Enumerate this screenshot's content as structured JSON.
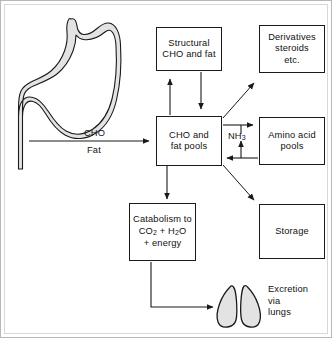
{
  "diagram": {
    "colors": {
      "stroke": "#1a1a1a",
      "organ_fill": "#e3e3e3",
      "page_border": "#b8b8b8",
      "background": "#ffffff"
    },
    "boxes": [
      {
        "id": "structural",
        "lines": [
          "Structural",
          "CHO and fat"
        ]
      },
      {
        "id": "derivatives",
        "lines": [
          "Derivatives",
          "steroids",
          "etc."
        ]
      },
      {
        "id": "central",
        "lines": [
          "CHO and",
          "fat pools"
        ]
      },
      {
        "id": "amino",
        "lines": [
          "Amino acid",
          "pools"
        ]
      },
      {
        "id": "catabolism",
        "lines": [
          "Catabolism to",
          "CO2 + H2O",
          "+ energy"
        ]
      },
      {
        "id": "storage",
        "lines": [
          "Storage"
        ]
      }
    ],
    "labels": {
      "cho": "CHO",
      "fat": "Fat",
      "nh3": "NH3",
      "excretion": [
        "Excretion",
        "via",
        "lungs"
      ]
    },
    "organs": [
      {
        "id": "stomach",
        "name": "stomach-illustration"
      },
      {
        "id": "lungs",
        "name": "lungs-illustration"
      }
    ],
    "arrows": [
      {
        "from": "stomach",
        "to": "central",
        "label": "CHO / Fat"
      },
      {
        "from": "central",
        "to": "structural",
        "label": ""
      },
      {
        "from": "structural",
        "to": "central",
        "label": ""
      },
      {
        "from": "central",
        "to": "derivatives",
        "label": ""
      },
      {
        "from": "central",
        "to": "amino",
        "label": ""
      },
      {
        "from": "amino",
        "to": "central",
        "label": ""
      },
      {
        "from": "amino",
        "to": "central",
        "label": "NH3"
      },
      {
        "from": "central",
        "to": "storage",
        "label": ""
      },
      {
        "from": "central",
        "to": "catabolism",
        "label": ""
      },
      {
        "from": "catabolism",
        "to": "lungs",
        "label": ""
      }
    ]
  }
}
